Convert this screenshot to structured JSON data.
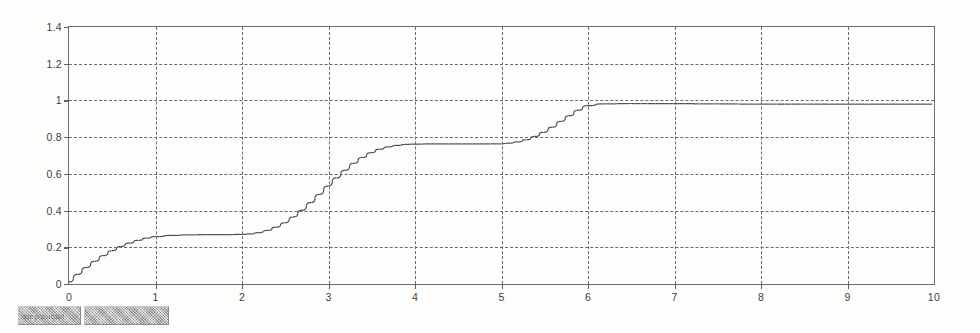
{
  "figure": {
    "background_color": "#fdfdfc",
    "axis_color": "#6e6e6e",
    "grid_color": "#6a6a6a",
    "curve_color": "#4a4a4a"
  },
  "bottom_toolbar": {
    "label_box_text": "step output",
    "blank_box_text": ""
  },
  "chart_data": {
    "type": "line",
    "title": "",
    "subtitle": "",
    "xlabel": "",
    "ylabel": "",
    "xlim": [
      0,
      10
    ],
    "ylim": [
      0,
      1.4
    ],
    "grid": true,
    "grid_style": "dashed",
    "legend": [],
    "legend_position": "none",
    "x_ticks": [
      0,
      1,
      2,
      3,
      4,
      5,
      6,
      7,
      8,
      9,
      10
    ],
    "x_tick_labels": [
      "0",
      "1",
      "2",
      "3",
      "4",
      "5",
      "6",
      "7",
      "8",
      "9",
      "10"
    ],
    "y_ticks": [
      0,
      0.2,
      0.4,
      0.6,
      0.8,
      1,
      1.2,
      1.4
    ],
    "y_tick_labels": [
      "0",
      "0.2",
      "0.4",
      "0.6",
      "0.8",
      "1",
      "1.2",
      "1.4"
    ],
    "series": [
      {
        "name": "step response",
        "line_style": "dotted",
        "x": [
          0,
          0.1,
          0.2,
          0.3,
          0.4,
          0.5,
          0.6,
          0.7,
          0.8,
          0.9,
          1.0,
          1.2,
          1.4,
          1.6,
          1.8,
          2.0,
          2.1,
          2.2,
          2.3,
          2.4,
          2.5,
          2.6,
          2.7,
          2.8,
          2.9,
          3.0,
          3.1,
          3.2,
          3.3,
          3.4,
          3.5,
          3.6,
          3.7,
          3.8,
          3.9,
          4.0,
          4.2,
          4.4,
          4.6,
          4.8,
          5.0,
          5.1,
          5.2,
          5.3,
          5.4,
          5.5,
          5.6,
          5.7,
          5.8,
          5.9,
          6.0,
          6.2,
          6.5,
          7.0,
          7.5,
          8.0,
          8.5,
          9.0,
          9.5,
          10.0
        ],
        "y": [
          0.0,
          0.042,
          0.08,
          0.114,
          0.145,
          0.172,
          0.195,
          0.214,
          0.229,
          0.241,
          0.249,
          0.256,
          0.259,
          0.26,
          0.26,
          0.261,
          0.264,
          0.271,
          0.283,
          0.301,
          0.325,
          0.357,
          0.394,
          0.436,
          0.481,
          0.527,
          0.572,
          0.614,
          0.652,
          0.684,
          0.71,
          0.729,
          0.742,
          0.75,
          0.755,
          0.757,
          0.758,
          0.758,
          0.758,
          0.758,
          0.759,
          0.762,
          0.769,
          0.781,
          0.799,
          0.822,
          0.85,
          0.882,
          0.913,
          0.943,
          0.968,
          0.978,
          0.98,
          0.979,
          0.978,
          0.977,
          0.977,
          0.976,
          0.976,
          0.976
        ]
      }
    ],
    "annotations": [
      {
        "text": "plateau 1",
        "value": 0.26,
        "x_range": [
          1.0,
          2.1
        ]
      },
      {
        "text": "plateau 2",
        "value": 0.758,
        "x_range": [
          4.0,
          5.0
        ]
      },
      {
        "text": "steady state",
        "value": 0.977,
        "x_range": [
          6.1,
          10.0
        ]
      }
    ]
  }
}
